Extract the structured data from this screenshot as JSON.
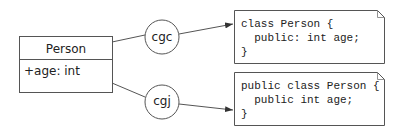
{
  "uml_class": {
    "name": "Person",
    "attributes": [
      "+age: int"
    ]
  },
  "generators": [
    {
      "label": "cgc"
    },
    {
      "label": "cgj"
    }
  ],
  "code_outputs": [
    {
      "lines": [
        "class Person {",
        "  public: int age;",
        "}"
      ]
    },
    {
      "lines": [
        "public class Person {",
        "  public int age;",
        "}"
      ]
    }
  ],
  "colors": {
    "stroke": "#555555",
    "text": "#222222",
    "background": "#ffffff"
  }
}
